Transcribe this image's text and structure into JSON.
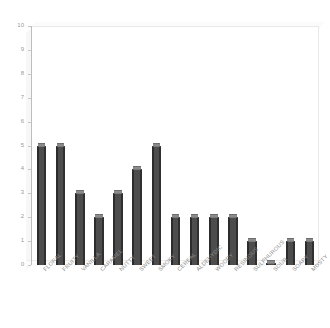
{
  "chart_data": {
    "type": "bar",
    "title": "",
    "subtitle": "",
    "xlabel": "",
    "ylabel": "",
    "ylim": [
      0,
      10
    ],
    "ytick_step": 1,
    "yticks": [
      10,
      9,
      8,
      7,
      6,
      5,
      4,
      3,
      2,
      1,
      0
    ],
    "grid": false,
    "legend": false,
    "legend_position": "none",
    "style": "3d-bar",
    "categories": [
      "FLORAL",
      "FRUITY",
      "VANILLA",
      "CARAMEL",
      "NUTTY",
      "SWEET",
      "SMOKY",
      "CEREAL",
      "ALDEHYDIC",
      "WOODY",
      "RESINOUS",
      "SULPHUROUS",
      "SOUR",
      "SOAPY",
      "MUSTY"
    ],
    "values": [
      5,
      5,
      3,
      2,
      3,
      4,
      5,
      2,
      2,
      2,
      2,
      1,
      0,
      1,
      1
    ]
  },
  "colors": {
    "bar_face": "#4d4d4d",
    "bar_edge": "#2c2c2c",
    "bar_top": "#8a8a8a",
    "axis_line": "#bdbdbd",
    "tick_text": "#9a9a9a",
    "label_text": "#8c8c8c",
    "plot_background": "#ffffff",
    "wall": "#f7f7f7",
    "page_background": "#ffffff"
  }
}
